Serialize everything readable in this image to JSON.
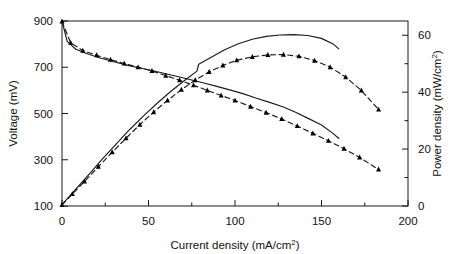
{
  "figure": {
    "background_color": "#ffffff",
    "line_color": "#1a1a1a",
    "marker_color": "#000000"
  },
  "axes": {
    "x": {
      "title_main": "Current density (mA/cm",
      "title_sup": "2",
      "title_tail": ")",
      "min": 0,
      "max": 200,
      "major_ticks": [
        0,
        50,
        100,
        150,
        200
      ],
      "minor_ticks": [
        25,
        75,
        125,
        175
      ],
      "tick_labels": [
        "0",
        "50",
        "100",
        "150",
        "200"
      ]
    },
    "y_left": {
      "title": "Voltage (mV)",
      "min": 100,
      "max": 900,
      "major_ticks": [
        100,
        300,
        500,
        700,
        900
      ],
      "tick_labels": [
        "100",
        "300",
        "500",
        "700",
        "900"
      ]
    },
    "y_right": {
      "title_main": "Power density (mW/cm",
      "title_sup": "2",
      "title_tail": ")",
      "min": 0,
      "max": 65,
      "major_ticks": [
        0,
        20,
        40,
        60
      ],
      "minor_ticks": [
        10,
        30,
        50
      ],
      "tick_labels": [
        "0",
        "20",
        "40",
        "60"
      ]
    },
    "grid": false,
    "frame": true
  },
  "chart_data": {
    "type": "line",
    "title": "",
    "subtitle": "",
    "xlabel": "Current density (mA/cm2)",
    "ylabel": "Voltage (mV)",
    "ylabel_secondary": "Power density (mW/cm2)",
    "xlim": [
      0,
      200
    ],
    "ylim": [
      100,
      900
    ],
    "ylim_secondary": [
      0,
      65
    ],
    "grid": false,
    "legend_position": "none",
    "series": [
      {
        "name": "Voltage - solid line",
        "axis": "left",
        "style": "solid-line",
        "markers": false,
        "x": [
          0,
          3,
          8,
          15,
          22,
          30,
          38,
          45,
          52,
          60,
          68,
          75,
          82,
          90,
          98,
          105,
          112,
          120,
          128,
          135,
          142,
          150,
          157,
          160
        ],
        "y": [
          900,
          812,
          778,
          757,
          740,
          724,
          708,
          697,
          686,
          672,
          658,
          645,
          632,
          616,
          600,
          585,
          567,
          548,
          528,
          505,
          480,
          450,
          412,
          392
        ]
      },
      {
        "name": "Voltage - dashed with triangles",
        "axis": "left",
        "style": "dashed-line",
        "markers": true,
        "marker_shape": "triangle-up",
        "x": [
          0,
          5,
          12,
          20,
          28,
          36,
          44,
          52,
          60,
          68,
          76,
          84,
          92,
          100,
          109,
          118,
          127,
          136,
          145,
          154,
          163,
          172,
          183
        ],
        "y": [
          898,
          806,
          772,
          752,
          733,
          716,
          700,
          684,
          664,
          644,
          622,
          600,
          578,
          556,
          530,
          504,
          476,
          446,
          414,
          382,
          348,
          310,
          258
        ]
      },
      {
        "name": "Power density - solid line",
        "axis": "right",
        "style": "solid-line",
        "markers": false,
        "x": [
          0,
          4,
          9,
          16,
          23,
          31,
          39,
          47,
          55,
          63,
          71,
          78,
          79,
          86,
          94,
          102,
          110,
          118,
          126,
          134,
          142,
          150,
          157,
          160
        ],
        "y": [
          0.5,
          3.2,
          6.6,
          11.4,
          16.3,
          21.6,
          26.8,
          31.6,
          36.1,
          40.3,
          44.2,
          47.4,
          49.8,
          52.2,
          54.9,
          57.0,
          58.6,
          59.6,
          60.1,
          60.2,
          59.9,
          58.9,
          56.8,
          55.2
        ]
      },
      {
        "name": "Power density - dashed with triangles",
        "axis": "right",
        "style": "dashed-line",
        "markers": true,
        "marker_shape": "triangle-up",
        "x": [
          0,
          6,
          13,
          21,
          29,
          37,
          45,
          53,
          61,
          69,
          77,
          85,
          93,
          101,
          110,
          119,
          128,
          137,
          146,
          155,
          164,
          173,
          183
        ],
        "y": [
          0.4,
          4.2,
          8.6,
          13.8,
          18.9,
          23.8,
          28.6,
          33.0,
          37.1,
          40.9,
          44.2,
          47.1,
          49.4,
          51.2,
          52.4,
          53.1,
          53.2,
          52.6,
          51.1,
          48.8,
          45.3,
          40.6,
          33.9
        ]
      }
    ],
    "annotations": []
  }
}
